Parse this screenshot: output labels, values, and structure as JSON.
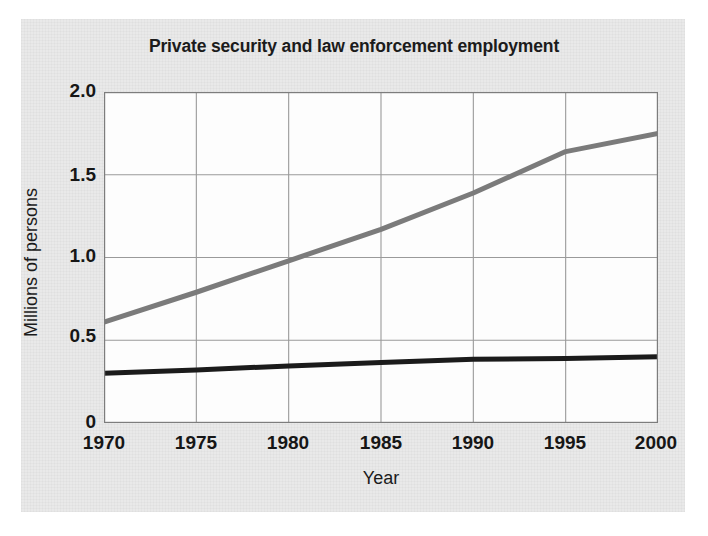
{
  "chart_data": {
    "type": "line",
    "title": "Private security and law enforcement employment",
    "xlabel": "Year",
    "ylabel": "Millions of persons",
    "x": [
      1970,
      1975,
      1980,
      1985,
      1990,
      1995,
      2000
    ],
    "xlim": [
      1970,
      2000
    ],
    "ylim": [
      0,
      2.0
    ],
    "xticks": [
      "1970",
      "1975",
      "1980",
      "1985",
      "1990",
      "1995",
      "2000"
    ],
    "yticks": [
      "2.0",
      "1.5",
      "1.0",
      "0.5",
      "0"
    ],
    "ytick_values": [
      2.0,
      1.5,
      1.0,
      0.5,
      0
    ],
    "grid": true,
    "legend": "none",
    "series": [
      {
        "name": "Private security",
        "color": "#7b7b7b",
        "values": [
          0.61,
          0.79,
          0.98,
          1.17,
          1.39,
          1.64,
          1.75
        ]
      },
      {
        "name": "Law enforcement",
        "color": "#1b1b1b",
        "values": [
          0.3,
          0.32,
          0.345,
          0.365,
          0.385,
          0.39,
          0.4
        ]
      }
    ]
  },
  "axes": {
    "ytick_labels": [
      "2.0",
      "1.5",
      "1.0",
      "0.5",
      "0"
    ],
    "xtick_labels": [
      "1970",
      "1975",
      "1980",
      "1985",
      "1990",
      "1995",
      "2000"
    ],
    "y_title": "Millions of persons",
    "x_title": "Year"
  },
  "colors": {
    "panel_background": "#e9e9e9",
    "plot_background": "#fdfdfd",
    "grid": "#9a9a9a",
    "axis": "#4a4a4a",
    "series_private_security": "#7b7b7b",
    "series_law_enforcement": "#1b1b1b",
    "text": "#161616"
  }
}
